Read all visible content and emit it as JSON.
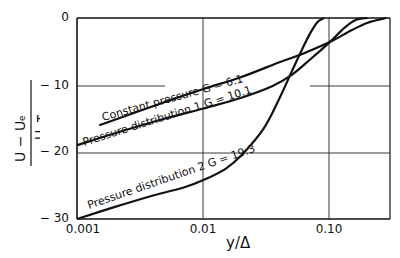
{
  "chart_data": {
    "type": "line",
    "title": "",
    "xlabel": "y/Δ",
    "ylabel": "(U − Uₑ)/U_τ",
    "x_scale": "log",
    "xlim": [
      0.001,
      0.3
    ],
    "ylim": [
      -30,
      0
    ],
    "x_ticks": [
      "0.001",
      "0.01",
      "0.10"
    ],
    "y_ticks": [
      "0",
      "− 10",
      "− 20",
      "− 30"
    ],
    "grid": true,
    "legend": "inline labels along curves",
    "series": [
      {
        "name": "Constant pressure G = 6.1",
        "label": "Constant pressure  G = 6.1",
        "x": [
          0.0015,
          0.003,
          0.006,
          0.01,
          0.02,
          0.04,
          0.06,
          0.1,
          0.15,
          0.2,
          0.28
        ],
        "y": [
          -16.0,
          -14.0,
          -12.0,
          -10.6,
          -8.8,
          -6.6,
          -5.4,
          -3.6,
          -1.8,
          -0.7,
          0.0
        ]
      },
      {
        "name": "Pressure distribution 1 G = 10.1",
        "label": "Pressure distribution  1  G = 10.1",
        "x": [
          0.001,
          0.002,
          0.005,
          0.01,
          0.02,
          0.035,
          0.05,
          0.07,
          0.1,
          0.13,
          0.16,
          0.2
        ],
        "y": [
          -19.0,
          -17.2,
          -15.0,
          -13.5,
          -11.9,
          -10.2,
          -8.5,
          -6.2,
          -3.6,
          -1.5,
          -0.3,
          0.0
        ]
      },
      {
        "name": "Pressure distribution 2 G = 19.3",
        "label": "Pressure distribution  2  G = 19.3",
        "x": [
          0.001,
          0.002,
          0.004,
          0.007,
          0.01,
          0.015,
          0.02,
          0.03,
          0.04,
          0.05,
          0.06,
          0.07,
          0.08,
          0.09
        ],
        "y": [
          -30.0,
          -28.2,
          -26.5,
          -25.3,
          -24.2,
          -22.5,
          -20.5,
          -16.5,
          -12.0,
          -8.0,
          -4.8,
          -2.3,
          -0.6,
          0.0
        ]
      }
    ]
  },
  "axes": {
    "y_ticks": [
      "0",
      "− 10",
      "− 20",
      "− 30"
    ],
    "x_ticks": [
      "0.001",
      "0.01",
      "0.10"
    ],
    "xlabel": "y/Δ",
    "ylabel_num": "U − Uₑ",
    "ylabel_den": "U_τ"
  },
  "labels": {
    "s1": "Constant pressure  G = 6.1",
    "s2": "Pressure distribution  1  G = 10.1",
    "s3": "Pressure distribution  2  G = 19.3"
  }
}
